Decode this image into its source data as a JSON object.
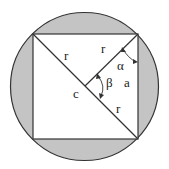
{
  "diagram": {
    "colors": {
      "fill": "#c4c4c4",
      "stroke": "#333333",
      "inner": "#ffffff"
    },
    "labels": {
      "r_left": "r",
      "r_upper": "r",
      "r_lower": "r",
      "c": "c",
      "alpha": "α",
      "beta": "β",
      "a": "a"
    }
  }
}
